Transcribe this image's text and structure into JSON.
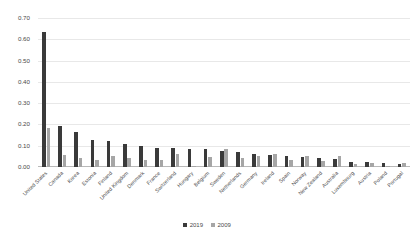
{
  "chart_data": {
    "type": "bar",
    "title": "",
    "subtitle": "",
    "xlabel": "",
    "ylabel": "",
    "ylim": [
      0.0,
      0.7
    ],
    "grid": true,
    "legend_position": "bottom-center",
    "ytick_labels": [
      "0.70",
      "0.60",
      "0.50",
      "0.40",
      "0.30",
      "0.20",
      "0.10",
      "0.00"
    ],
    "ytick_values": [
      0.7,
      0.6,
      0.5,
      0.4,
      0.3,
      0.2,
      0.1,
      0.0
    ],
    "categories": [
      "United States",
      "Canada",
      "Korea",
      "Estonia",
      "Finland",
      "United Kingdom",
      "Denmark",
      "France",
      "Switzerland",
      "Hungary",
      "Belgium",
      "Sweden",
      "Netherlands",
      "Germany",
      "Ireland",
      "Spain",
      "Norway",
      "New Zealand",
      "Australia",
      "Luxembourg",
      "Austria",
      "Poland",
      "Portugal"
    ],
    "series": [
      {
        "name": "2019",
        "color": "#3a3a3a",
        "values": [
          0.632,
          0.193,
          0.166,
          0.127,
          0.121,
          0.106,
          0.099,
          0.09,
          0.087,
          0.086,
          0.083,
          0.077,
          0.07,
          0.063,
          0.058,
          0.05,
          0.047,
          0.043,
          0.04,
          0.025,
          0.024,
          0.019,
          0.015
        ]
      },
      {
        "name": "2009",
        "color": "#a6a6a6",
        "values": [
          0.185,
          0.058,
          0.042,
          0.035,
          0.052,
          0.041,
          0.035,
          0.031,
          0.062,
          0.005,
          0.048,
          0.084,
          0.044,
          0.05,
          0.061,
          0.031,
          0.05,
          0.026,
          0.051,
          0.013,
          0.021,
          0.007,
          0.017
        ]
      }
    ]
  },
  "legend": {
    "items": [
      {
        "label": "2019",
        "color": "#3a3a3a"
      },
      {
        "label": "2009",
        "color": "#a6a6a6"
      }
    ]
  }
}
